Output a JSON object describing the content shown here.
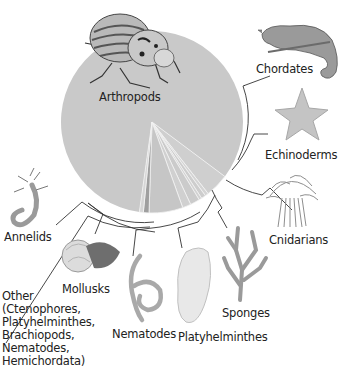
{
  "chart_data": {
    "type": "pie",
    "title": "",
    "unit": "percent of animal species (approximate)",
    "start_angle_deg": 90,
    "direction": "clockwise",
    "slices": [
      {
        "name": "Arthropods",
        "value": 83.0,
        "color": "#c9c9c9"
      },
      {
        "name": "Chordates",
        "value": 4.2,
        "color": "#cfcfcf"
      },
      {
        "name": "Echinoderms",
        "value": 0.6,
        "color": "#d4d4d4"
      },
      {
        "name": "Cnidarians",
        "value": 0.8,
        "color": "#cdcdcd"
      },
      {
        "name": "Sponges",
        "value": 0.5,
        "color": "#d2d2d2"
      },
      {
        "name": "Platyhelminthes",
        "value": 1.7,
        "color": "#cbcbcb"
      },
      {
        "name": "Nematodes",
        "value": 1.5,
        "color": "#d0d0d0"
      },
      {
        "name": "Mollusks",
        "value": 6.0,
        "color": "#c6c6c6"
      },
      {
        "name": "Annelids",
        "value": 1.0,
        "color": "#9f9f9f"
      },
      {
        "name": "Other",
        "value": 0.7,
        "color": "#d6d6d6"
      }
    ],
    "legend": "none (callout labels with bracket leader lines)",
    "labels": [
      "Arthropods",
      "Chordates",
      "Echinoderms",
      "Cnidarians",
      "Sponges",
      "Platyhelminthes",
      "Nematodes",
      "Mollusks",
      "Annelids",
      "Other (Ctenophores, Platyhelminthes, Brachiopods, Nematodes, Hemichordata)"
    ]
  },
  "labels": {
    "arthropods": "Arthropods",
    "chordates": "Chordates",
    "echinoderms": "Echinoderms",
    "cnidarians": "Cnidarians",
    "sponges": "Sponges",
    "platyhelminthes": "Platyhelminthes",
    "nematodes": "Nematodes",
    "mollusks": "Mollusks",
    "annelids": "Annelids",
    "other": "Other\n(Ctenophores,\nPlatyhelminthes,\nBrachiopods,\nNematodes,\nHemichordata)"
  },
  "style": {
    "pie_color": "#c9c9c9",
    "slice_edge_color": "#f2f2f2",
    "leader_color": "#333333"
  }
}
